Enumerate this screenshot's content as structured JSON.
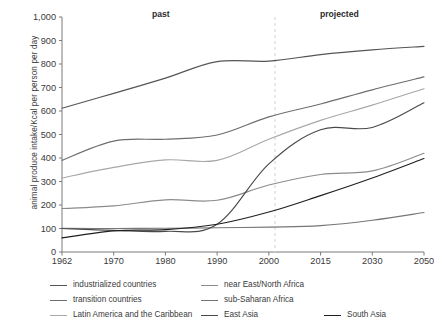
{
  "chart_data": {
    "type": "line",
    "title": "",
    "xlabel": "",
    "ylabel": "animal produce intake/Kcal per person per day",
    "x": [
      "1962",
      "1970",
      "1980",
      "1990",
      "2000",
      "2015",
      "2030",
      "2050"
    ],
    "xlim": [
      0,
      7
    ],
    "ylim": [
      0,
      1000
    ],
    "yticks": [
      "0",
      "100",
      "200",
      "300",
      "400",
      "500",
      "600",
      "700",
      "800",
      "900",
      "1,000"
    ],
    "grid": false,
    "legend_position": "bottom",
    "annotations": [
      {
        "text": "past",
        "x": "1985"
      },
      {
        "text": "projected",
        "x": "2020"
      }
    ],
    "divider": {
      "label": "2003",
      "note": "dashed vertical separator between past and projected"
    },
    "series": [
      {
        "name": "industrialized countries",
        "color": "#555555",
        "values": [
          612,
          675,
          740,
          810,
          812,
          840,
          860,
          875
        ]
      },
      {
        "name": "transition countries",
        "color": "#6e6e6e",
        "values": [
          390,
          472,
          480,
          498,
          575,
          630,
          690,
          745
        ]
      },
      {
        "name": "Latin America and the Caribbean",
        "color": "#a8a8a8",
        "values": [
          315,
          360,
          392,
          390,
          480,
          560,
          625,
          695
        ]
      },
      {
        "name": "near East/North Africa",
        "color": "#8c8c8c",
        "values": [
          185,
          196,
          222,
          220,
          285,
          330,
          345,
          420
        ]
      },
      {
        "name": "sub-Saharan Africa",
        "color": "#767676",
        "values": [
          101,
          100,
          101,
          103,
          106,
          112,
          135,
          168
        ]
      },
      {
        "name": "East Asia",
        "color": "#4a4a4a",
        "values": [
          100,
          92,
          88,
          118,
          375,
          520,
          530,
          635
        ]
      },
      {
        "name": "South Asia",
        "color": "#1f1f1f",
        "values": [
          60,
          90,
          95,
          118,
          170,
          240,
          315,
          398
        ]
      }
    ]
  },
  "axis": {
    "y_ticks": [
      "1,000",
      "900",
      "800",
      "700",
      "600",
      "500",
      "400",
      "300",
      "200",
      "100",
      "0"
    ],
    "x_ticks": [
      "1962",
      "1970",
      "1980",
      "1990",
      "2000",
      "2015",
      "2030",
      "2050"
    ],
    "y_title": "animal produce intake/Kcal per person per day"
  },
  "periods": {
    "past": "past",
    "projected": "projected"
  },
  "legend": {
    "col1": [
      {
        "label": "industrialized countries",
        "color": "#555555"
      },
      {
        "label": "transition countries",
        "color": "#6e6e6e"
      },
      {
        "label": "Latin America and the Caribbean",
        "color": "#a8a8a8"
      }
    ],
    "col2": [
      {
        "label": "near East/North Africa",
        "color": "#8c8c8c"
      },
      {
        "label": "sub-Saharan Africa",
        "color": "#767676"
      },
      {
        "label": "East Asia",
        "color": "#4a4a4a"
      }
    ],
    "col3": [
      {
        "label": "South Asia",
        "color": "#1f1f1f"
      }
    ]
  }
}
